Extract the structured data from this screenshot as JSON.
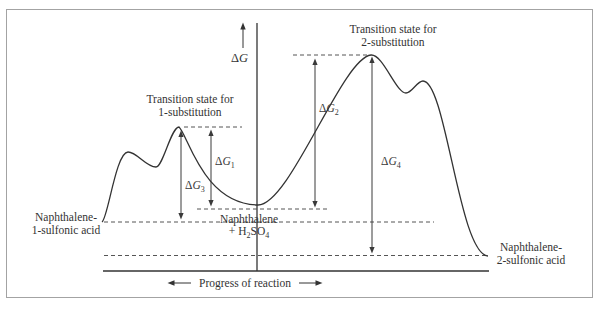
{
  "colors": {
    "line": "#333333",
    "text": "#333333",
    "dashed": "#555555",
    "frame": "#a3a3a3",
    "background": "#ffffff"
  },
  "axis": {
    "y_label": {
      "delta": "Δ",
      "g": "G"
    },
    "x_label": "Progress of reaction"
  },
  "transition_states": {
    "ts1": {
      "line1": "Transition state for",
      "line2": "1-substitution"
    },
    "ts2": {
      "line1": "Transition state for",
      "line2": "2-substitution"
    }
  },
  "energy_gaps": {
    "dg1": {
      "delta": "Δ",
      "g": "G",
      "sub": "1"
    },
    "dg2": {
      "delta": "Δ",
      "g": "G",
      "sub": "2"
    },
    "dg3": {
      "delta": "Δ",
      "g": "G",
      "sub": "3"
    },
    "dg4": {
      "delta": "Δ",
      "g": "G",
      "sub": "4"
    }
  },
  "species": {
    "reactant": {
      "line1": "Naphthalene",
      "plus": "+ H",
      "sub_a": "2",
      "mid": "SO",
      "sub_b": "4"
    },
    "product1": {
      "line1": "Naphthalene-",
      "line2": "1-sulfonic acid"
    },
    "product2": {
      "line1": "Naphthalene-",
      "line2": "2-sulfonic acid"
    }
  }
}
